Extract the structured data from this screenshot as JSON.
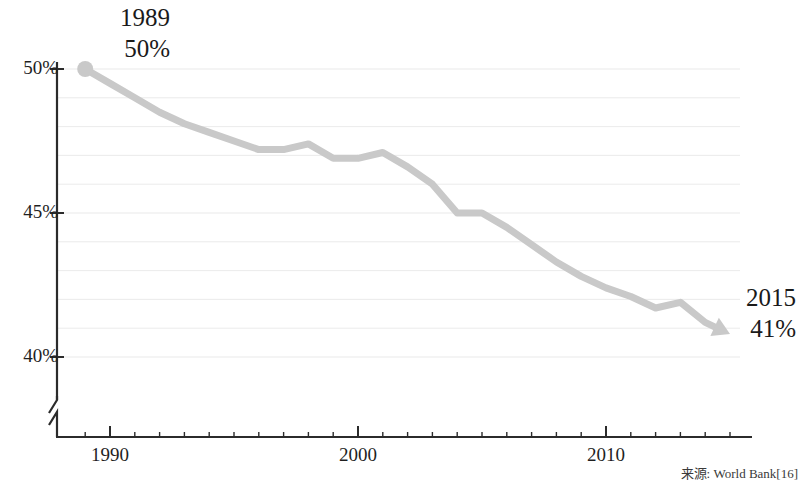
{
  "annotations": {
    "start": {
      "year": "1989",
      "value": "50%"
    },
    "end": {
      "year": "2015",
      "value": "41%"
    }
  },
  "source_note": "来源: World Bank[16]",
  "axis": {
    "y_ticks": [
      "50%",
      "45%",
      "40%"
    ],
    "x_ticks": [
      "1990",
      "2000",
      "2010"
    ]
  },
  "colors": {
    "line": "#c9c9c9",
    "gridline": "#e9e9e9",
    "axis": "#2b2b2b",
    "text": "#1a1a1a"
  },
  "chart_data": {
    "type": "line",
    "title": "",
    "subtitle": "",
    "xlabel": "",
    "ylabel": "",
    "xlim": [
      1988.4,
      2015.6
    ],
    "ylim": [
      39.0,
      50.4
    ],
    "grid": true,
    "grid_interval": 1,
    "legend": "none",
    "x_tick_labels": [
      "1990",
      "2000",
      "2010"
    ],
    "y_tick_labels": [
      "50%",
      "45%",
      "40%"
    ],
    "y_major_ticks": [
      50,
      45,
      40
    ],
    "axis_break": true,
    "marker_start": true,
    "arrow_end": true,
    "x": [
      1989,
      1990,
      1991,
      1992,
      1993,
      1994,
      1995,
      1996,
      1997,
      1998,
      1999,
      2000,
      2001,
      2002,
      2003,
      2004,
      2005,
      2006,
      2007,
      2008,
      2009,
      2010,
      2011,
      2012,
      2013,
      2014,
      2015
    ],
    "series": [
      {
        "name": "Labor share of GDP",
        "units": "%",
        "values": [
          50.0,
          49.5,
          49.0,
          48.5,
          48.1,
          47.8,
          47.5,
          47.2,
          47.2,
          47.4,
          46.9,
          46.9,
          47.1,
          46.6,
          46.0,
          45.0,
          45.0,
          44.5,
          43.9,
          43.3,
          42.8,
          42.4,
          42.1,
          41.7,
          41.9,
          41.2,
          40.8
        ]
      }
    ],
    "annotations": [
      {
        "x": 1989,
        "y": 50.0,
        "text": "1989 50%"
      },
      {
        "x": 2015,
        "y": 41.0,
        "text": "2015 41%"
      }
    ]
  }
}
